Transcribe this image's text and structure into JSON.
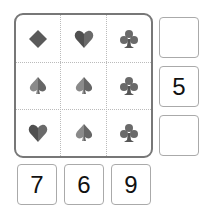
{
  "puzzle": {
    "grid": [
      [
        "diamond",
        "heart",
        "club"
      ],
      [
        "spade",
        "spade",
        "club"
      ],
      [
        "heart",
        "spade",
        "club"
      ]
    ],
    "row_clues": [
      "",
      "5",
      ""
    ],
    "column_clues": [
      "7",
      "6",
      "9"
    ]
  },
  "colors": {
    "suit_dark": "#555555",
    "suit_light": "#8a8a8a",
    "grid_border": "#777777",
    "clue_border": "#aaaaaa"
  }
}
